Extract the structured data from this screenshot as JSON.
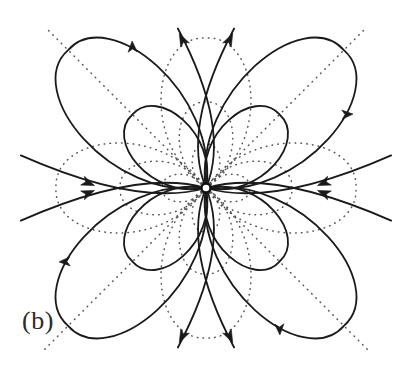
{
  "figure": {
    "panel_label": "(b)",
    "kind": "quadrupole-field-line-diagram",
    "background_color": "#ffffff",
    "solid_line_color": "#1a1a1a",
    "dotted_line_color": "#555555",
    "label_color": "#2b2b2b"
  },
  "chart_data": {
    "type": "line",
    "title": "",
    "subtitle": "",
    "xlabel": "",
    "ylabel": "",
    "grid": false,
    "legend_position": "none",
    "annotations": [
      "(b)"
    ],
    "axis_ranges": {
      "x": [
        0,
        413
      ],
      "y": [
        0,
        374
      ]
    },
    "center": {
      "x": 206,
      "y": 188
    },
    "center_marker": {
      "shape": "circle",
      "radius": 4.5,
      "fill": "#ffffff",
      "stroke": "#111111"
    },
    "symmetry": "4-fold (quadrupole), mirror about both axes and both diagonals",
    "diagonal_guides": {
      "style": "dotted",
      "count": 2,
      "angles_deg": [
        45,
        135
      ],
      "half_length": 228,
      "description": "two dotted straight asymptote lines through the centre along the diagonals"
    },
    "series": [
      {
        "name": "outer-lobe-top-right",
        "style": "solid",
        "closed": true,
        "axis_angle_deg": 45,
        "length": 195,
        "width": 120,
        "arrow": {
          "t": 0.34,
          "direction": "outward"
        }
      },
      {
        "name": "outer-lobe-top-left",
        "style": "solid",
        "closed": true,
        "axis_angle_deg": 135,
        "length": 195,
        "width": 120,
        "arrow": {
          "t": 0.34,
          "direction": "outward"
        }
      },
      {
        "name": "outer-lobe-bottom-left",
        "style": "solid",
        "closed": true,
        "axis_angle_deg": 225,
        "length": 195,
        "width": 120,
        "arrow": {
          "t": 0.34,
          "direction": "outward"
        }
      },
      {
        "name": "outer-lobe-bottom-right",
        "style": "solid",
        "closed": true,
        "axis_angle_deg": 315,
        "length": 195,
        "width": 120,
        "arrow": {
          "t": 0.34,
          "direction": "outward"
        }
      },
      {
        "name": "inner-lobe-top-right",
        "style": "solid",
        "closed": true,
        "axis_angle_deg": 45,
        "length": 104,
        "width": 74,
        "arrow": null
      },
      {
        "name": "inner-lobe-top-left",
        "style": "solid",
        "closed": true,
        "axis_angle_deg": 135,
        "length": 104,
        "width": 74,
        "arrow": null
      },
      {
        "name": "inner-lobe-bottom-left",
        "style": "solid",
        "closed": true,
        "axis_angle_deg": 225,
        "length": 104,
        "width": 74,
        "arrow": null
      },
      {
        "name": "inner-lobe-bottom-right",
        "style": "solid",
        "closed": true,
        "axis_angle_deg": 315,
        "length": 104,
        "width": 74,
        "arrow": null
      },
      {
        "name": "open-field-line-up-left",
        "style": "solid",
        "closed": false,
        "exit_angle_deg": 97,
        "arrow": {
          "direction": "outward",
          "head_at": {
            "x": 182,
            "y": 30
          }
        }
      },
      {
        "name": "open-field-line-up-right",
        "style": "solid",
        "closed": false,
        "exit_angle_deg": 83,
        "arrow": {
          "direction": "outward",
          "head_at": {
            "x": 232,
            "y": 30
          }
        }
      },
      {
        "name": "open-field-line-down-left",
        "style": "solid",
        "closed": false,
        "exit_angle_deg": 263,
        "arrow": {
          "direction": "outward",
          "head_at": {
            "x": 182,
            "y": 346
          }
        }
      },
      {
        "name": "open-field-line-down-right",
        "style": "solid",
        "closed": false,
        "exit_angle_deg": 277,
        "arrow": {
          "direction": "outward",
          "head_at": {
            "x": 232,
            "y": 346
          }
        }
      },
      {
        "name": "open-field-line-left-upper",
        "style": "solid",
        "closed": false,
        "exit_angle_deg": 173,
        "arrow": {
          "direction": "inward",
          "head_at": {
            "x": 66,
            "y": 160
          }
        }
      },
      {
        "name": "open-field-line-left-lower",
        "style": "solid",
        "closed": false,
        "exit_angle_deg": 187,
        "arrow": {
          "direction": "inward",
          "head_at": {
            "x": 66,
            "y": 216
          }
        }
      },
      {
        "name": "open-field-line-right-upper",
        "style": "solid",
        "closed": false,
        "exit_angle_deg": 7,
        "arrow": {
          "direction": "inward",
          "head_at": {
            "x": 346,
            "y": 160
          }
        }
      },
      {
        "name": "open-field-line-right-lower",
        "style": "solid",
        "closed": false,
        "exit_angle_deg": 353,
        "arrow": {
          "direction": "inward",
          "head_at": {
            "x": 346,
            "y": 216
          }
        }
      },
      {
        "name": "equipotential-outer-petals",
        "style": "dotted",
        "closed": true,
        "count": 4,
        "axis_angles_deg": [
          0,
          90,
          180,
          270
        ],
        "length": 150,
        "width": 104
      },
      {
        "name": "equipotential-inner-petals",
        "style": "dotted",
        "closed": true,
        "count": 4,
        "axis_angles_deg": [
          0,
          90,
          180,
          270
        ],
        "length": 86,
        "width": 62
      },
      {
        "name": "equipotential-innermost-petals",
        "style": "dotted",
        "closed": true,
        "count": 4,
        "axis_angles_deg": [
          0,
          90,
          180,
          270
        ],
        "length": 44,
        "width": 32
      }
    ]
  }
}
